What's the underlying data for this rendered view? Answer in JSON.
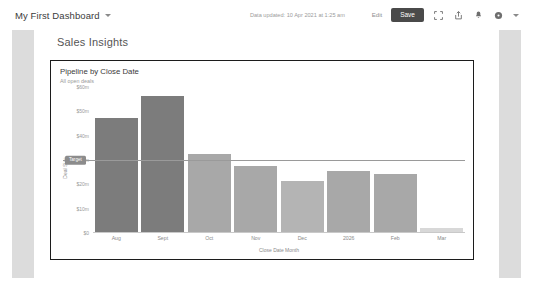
{
  "toolbar": {
    "dashboard_name": "My First Dashboard",
    "dropdown_icon": "chevron-down-icon",
    "updated_text": "Data updated: 10 Apr 2021 at 1:25 am",
    "edit_label": "Edit",
    "save_label": "Save",
    "icons": [
      {
        "name": "fullscreen-icon",
        "label": "Fullscreen"
      },
      {
        "name": "share-icon",
        "label": "Share"
      },
      {
        "name": "bell-icon",
        "label": "Notifications"
      },
      {
        "name": "help-icon",
        "label": "Help"
      },
      {
        "name": "chevron-down-icon",
        "label": "More"
      }
    ]
  },
  "page": {
    "heading": "Sales Insights"
  },
  "card": {
    "title": "Pipeline by Close Date",
    "subtitle": "All open deals"
  },
  "colors": {
    "bar_dark": "#7c7c7c",
    "bar_light": "#a8a8a8",
    "bar_faint": "#d8d8d8",
    "target_line": "#9a9a9a",
    "save_button": "#4a4a4a",
    "card_border": "#1c1c1c",
    "side_band": "#dcdcdc"
  },
  "chart_data": {
    "type": "bar",
    "title": "Pipeline by Close Date",
    "subtitle": "All open deals",
    "xlabel": "Close Date Month",
    "ylabel": "Deal Size",
    "categories": [
      "Aug",
      "Sept",
      "Oct",
      "Nov",
      "Dec",
      "2026",
      "Feb",
      "Mar"
    ],
    "values": [
      47,
      56,
      32,
      27,
      21,
      25,
      24,
      1.5
    ],
    "bar_colors": [
      "#7c7c7c",
      "#7c7c7c",
      "#a8a8a8",
      "#a8a8a8",
      "#b4b4b4",
      "#a8a8a8",
      "#a8a8a8",
      "#d8d8d8"
    ],
    "ylim": [
      0,
      60
    ],
    "yticks": [
      0,
      10,
      20,
      30,
      40,
      50,
      60
    ],
    "ytick_labels": [
      "$0",
      "$10m",
      "$20m",
      "$30m",
      "$40m",
      "$50m",
      "$60m"
    ],
    "grid": false,
    "legend": "none",
    "reference_line": {
      "label": "Target",
      "value": 30
    }
  }
}
